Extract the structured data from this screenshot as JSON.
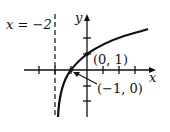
{
  "diagram": {
    "type": "function-graph",
    "asymptote_label": "x = −2",
    "x_axis_label": "x",
    "y_axis_label": "y",
    "points": [
      {
        "label": "(0, 1)",
        "x": 0,
        "y": 1
      },
      {
        "label": "(−1, 0)",
        "x": -1,
        "y": 0
      }
    ],
    "asymptote_x": -2,
    "colors": {
      "ink": "#111111",
      "background": "#ffffff"
    }
  }
}
